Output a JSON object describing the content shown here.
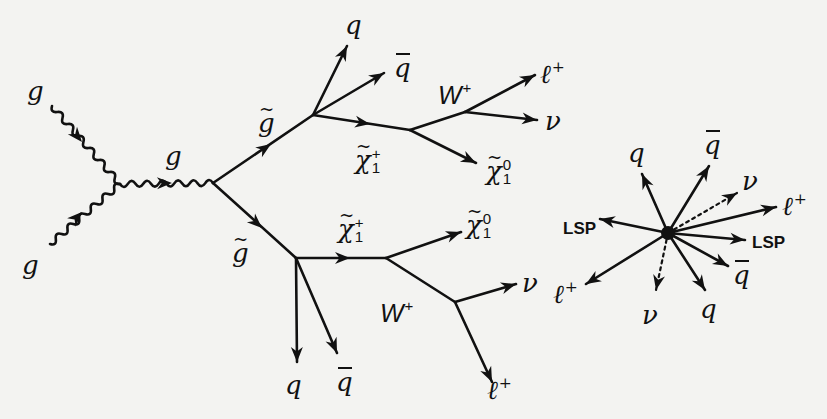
{
  "diagram": {
    "colors": {
      "background": "#f3f3f1",
      "ink": "#111111"
    },
    "feynman": {
      "incoming": [
        {
          "particle": "gluon",
          "label": "g"
        },
        {
          "particle": "gluon",
          "label": "g"
        }
      ],
      "propagator": {
        "particle": "gluon",
        "label": "g"
      },
      "upper_branch": {
        "parent": {
          "label": "g̃",
          "name": "gluino"
        },
        "products": [
          {
            "label": "q"
          },
          {
            "label": "q̄"
          },
          {
            "label": "χ̃1+",
            "name": "chargino",
            "decays": [
              {
                "label": "W+",
                "decays": [
                  {
                    "label": "ℓ+"
                  },
                  {
                    "label": "ν"
                  }
                ]
              },
              {
                "label": "χ̃1⁰",
                "name": "neutralino"
              }
            ]
          }
        ]
      },
      "lower_branch": {
        "parent": {
          "label": "g̃",
          "name": "gluino"
        },
        "products": [
          {
            "label": "q"
          },
          {
            "label": "q̄"
          },
          {
            "label": "χ̃1+",
            "name": "chargino",
            "decays": [
              {
                "label": "χ̃1⁰",
                "name": "neutralino"
              },
              {
                "label": "W+",
                "decays": [
                  {
                    "label": "ν"
                  },
                  {
                    "label": "ℓ+"
                  }
                ]
              }
            ]
          }
        ]
      }
    },
    "event_display": {
      "particles": [
        {
          "label": "q",
          "style": "solid"
        },
        {
          "label": "q̄",
          "style": "solid"
        },
        {
          "label": "ν",
          "style": "dotted"
        },
        {
          "label": "ℓ+",
          "style": "solid"
        },
        {
          "label": "LSP",
          "style": "solid"
        },
        {
          "label": "q̄",
          "style": "solid"
        },
        {
          "label": "q",
          "style": "solid"
        },
        {
          "label": "ν",
          "style": "dotted"
        },
        {
          "label": "ℓ+",
          "style": "solid"
        },
        {
          "label": "LSP",
          "style": "solid"
        }
      ]
    },
    "text": {
      "g": "g",
      "q": "q",
      "nu": "ν",
      "ell": "ℓ",
      "plus": "+",
      "W": "W",
      "chi": "χ",
      "sub1": "1",
      "zero": "0",
      "lsp": "LSP"
    }
  }
}
